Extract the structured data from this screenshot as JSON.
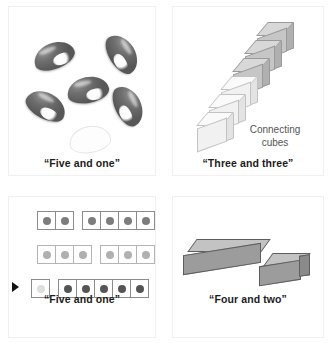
{
  "figure": {
    "panels": [
      {
        "id": "beans-panel",
        "caption": "“Five and one”",
        "manipulative": "beans",
        "dark_bean_count": 5,
        "outline_bean_count": 1
      },
      {
        "id": "cubes-panel",
        "caption": "“Three and three”",
        "manipulative": "connecting cubes",
        "label": "Connecting cubes",
        "label_line_1": "Connecting",
        "label_line_2": "cubes",
        "dark_cube_count": 3,
        "light_cube_count": 3
      },
      {
        "id": "dot-rows-panel",
        "caption": "“Five and one”",
        "manipulative": "dot cards",
        "rows": [
          {
            "left_count": 2,
            "right_count": 4,
            "shade": "mid",
            "pointer": false
          },
          {
            "left_count": 3,
            "right_count": 3,
            "shade": "lite",
            "pointer": false
          },
          {
            "left_count": 1,
            "right_count": 5,
            "shade": "dark",
            "pointer": true
          }
        ]
      },
      {
        "id": "bar-panel",
        "caption": "“Four and two”",
        "manipulative": "cuisenaire rod",
        "left_units": 4,
        "right_units": 2
      }
    ],
    "colors": {
      "bean_fill": "#6e6e6e",
      "cube_dark": "#c6c6c6",
      "cube_light": "#f1f1f1",
      "bar_front": "#9c9c9c",
      "caption_text": "#1c1c1c",
      "label_text": "#555555"
    }
  }
}
